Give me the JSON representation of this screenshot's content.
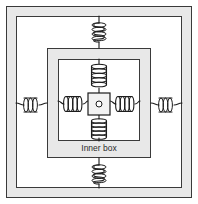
{
  "figure": {
    "label_inner_box": "Inner box",
    "colors": {
      "background": "#ffffff",
      "frame_band": "#e8e8e8",
      "frame_line": "#3a3a3a",
      "spring_line": "#1c1c1c",
      "mass_fill": "#f2f2f2"
    },
    "frames": [
      {
        "name": "outer-frame",
        "x": 6,
        "y": 6,
        "width": 186,
        "height": 192,
        "band": 10,
        "fill": "#e8e8e8"
      },
      {
        "name": "middle-frame",
        "x": 47,
        "y": 48,
        "width": 104,
        "height": 110,
        "band": 11,
        "fill": "#e8e8e8"
      },
      {
        "name": "inner-frame",
        "x": 58,
        "y": 59,
        "width": 82,
        "height": 82,
        "band": 0,
        "fill": "#ffffff"
      }
    ],
    "mass": {
      "name": "center-mass",
      "x": 88,
      "y": 93,
      "width": 22,
      "height": 22,
      "dot_radius": 3
    },
    "springs": [
      {
        "name": "spring-outer-top",
        "orientation": "vertical",
        "coils": 4
      },
      {
        "name": "spring-outer-bottom",
        "orientation": "vertical",
        "coils": 4
      },
      {
        "name": "spring-outer-left",
        "orientation": "horizontal",
        "coils": 3
      },
      {
        "name": "spring-outer-right",
        "orientation": "horizontal",
        "coils": 3
      },
      {
        "name": "spring-inner-top",
        "orientation": "vertical",
        "coils": 5
      },
      {
        "name": "spring-inner-bottom",
        "orientation": "vertical",
        "coils": 5
      },
      {
        "name": "spring-inner-left",
        "orientation": "horizontal",
        "coils": 4
      },
      {
        "name": "spring-inner-right",
        "orientation": "horizontal",
        "coils": 4
      }
    ]
  }
}
